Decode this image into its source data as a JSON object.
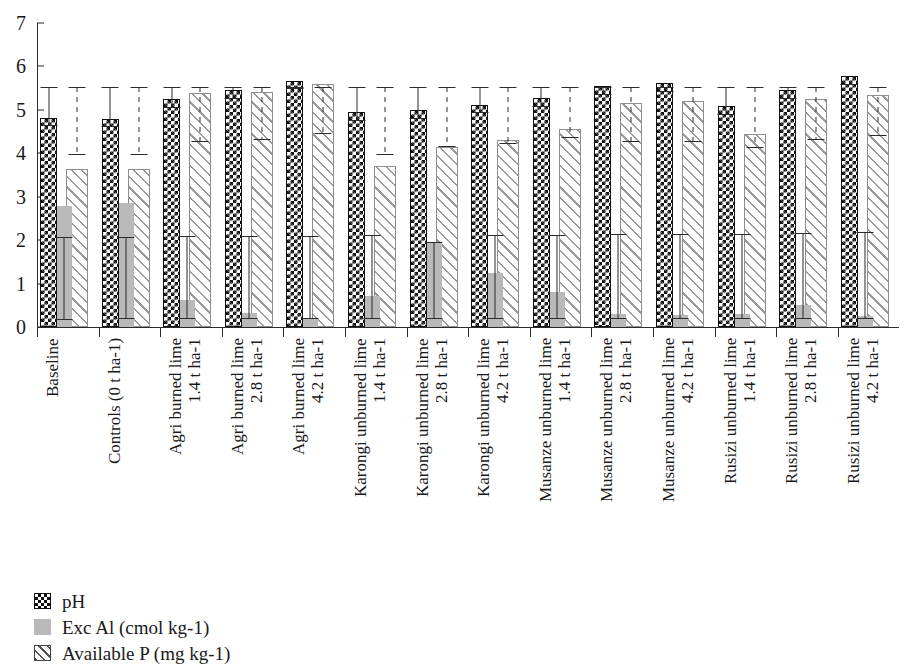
{
  "chart_data": {
    "type": "bar",
    "title": "",
    "xlabel": "",
    "ylabel": "",
    "ylim": [
      0,
      7
    ],
    "ytick_labels": [
      "0",
      "1",
      "2",
      "3",
      "4",
      "5",
      "6",
      "7"
    ],
    "yticks": [
      0,
      1,
      2,
      3,
      4,
      5,
      6,
      7
    ],
    "grid": false,
    "legend_position": "bottom-left",
    "categories": [
      "Baseline",
      "Controls (0 t ha-1)",
      "Agri burned lime\n1.4 t ha-1",
      "Agri burned lime\n2.8 t ha-1",
      "Agri burned lime\n4.2 t ha-1",
      "Karongi unburned lime\n1.4 t ha-1",
      "Karongi unburned lime\n2.8 t ha-1",
      "Karongi unburned lime\n4.2 t ha-1",
      "Musanze unburned lime\n1.4 t ha-1",
      "Musanze unburned lime\n2.8 t ha-1",
      "Musanze unburned lime\n4.2 t ha-1",
      "Rusizi unburned lime\n1.4 t ha-1",
      "Rusizi unburned lime\n2.8 t ha-1",
      "Rusizi unburned lime\n4.2 t ha-1"
    ],
    "series": [
      {
        "name": "pH",
        "key": "ph",
        "pattern": "checkerboard",
        "color": "#111111",
        "values": [
          4.82,
          4.8,
          5.25,
          5.45,
          5.67,
          4.95,
          5.0,
          5.12,
          5.27,
          5.55,
          5.62,
          5.08,
          5.45,
          5.78
        ],
        "err_low": [
          4.62,
          4.6,
          5.05,
          5.25,
          5.47,
          4.75,
          4.8,
          4.92,
          5.07,
          5.35,
          5.42,
          4.88,
          5.25,
          5.58
        ],
        "err_high": [
          5.53,
          5.53,
          5.53,
          5.53,
          5.53,
          5.53,
          5.53,
          5.53,
          5.53,
          5.53,
          5.53,
          5.53,
          5.53,
          5.53
        ],
        "err_style": "solid"
      },
      {
        "name": "Exc Al (cmol kg-1)",
        "key": "exc_al",
        "pattern": "solid-gray",
        "color": "#b9b9b9",
        "values": [
          2.78,
          2.86,
          0.63,
          0.33,
          0.21,
          0.72,
          1.93,
          1.25,
          0.8,
          0.3,
          0.28,
          0.29,
          0.5,
          0.26
        ],
        "err_low": [
          0.17,
          0.18,
          0.18,
          0.18,
          0.18,
          0.18,
          0.18,
          0.18,
          0.18,
          0.18,
          0.18,
          0.18,
          0.18,
          0.18
        ],
        "err_high": [
          2.07,
          2.08,
          2.09,
          2.09,
          2.1,
          2.11,
          1.95,
          2.12,
          2.13,
          2.14,
          2.15,
          2.14,
          2.17,
          2.18
        ],
        "err_style": "solid"
      },
      {
        "name": "Available P (mg kg-1)",
        "key": "available_p",
        "pattern": "diagonal-hatch",
        "color": "#9a9a9a",
        "values": [
          3.65,
          3.63,
          5.4,
          5.42,
          5.6,
          3.7,
          4.15,
          4.3,
          4.55,
          5.15,
          5.2,
          4.45,
          5.25,
          5.35
        ],
        "err_low": [
          3.95,
          3.95,
          4.25,
          4.3,
          4.45,
          3.97,
          4.15,
          4.22,
          4.35,
          4.25,
          4.25,
          4.12,
          4.3,
          4.4
        ],
        "err_high": [
          5.53,
          5.53,
          5.53,
          5.53,
          5.53,
          5.53,
          5.53,
          5.53,
          5.53,
          5.53,
          5.53,
          5.53,
          5.53,
          5.53
        ],
        "err_style": "dashed"
      }
    ]
  },
  "legend": {
    "items": [
      {
        "label": "pH",
        "swatch": "ph-swatch-icon"
      },
      {
        "label": "Exc Al (cmol kg-1)",
        "swatch": "exc-al-swatch-icon"
      },
      {
        "label": "Available P (mg kg-1)",
        "swatch": "available-p-swatch-icon"
      }
    ]
  }
}
